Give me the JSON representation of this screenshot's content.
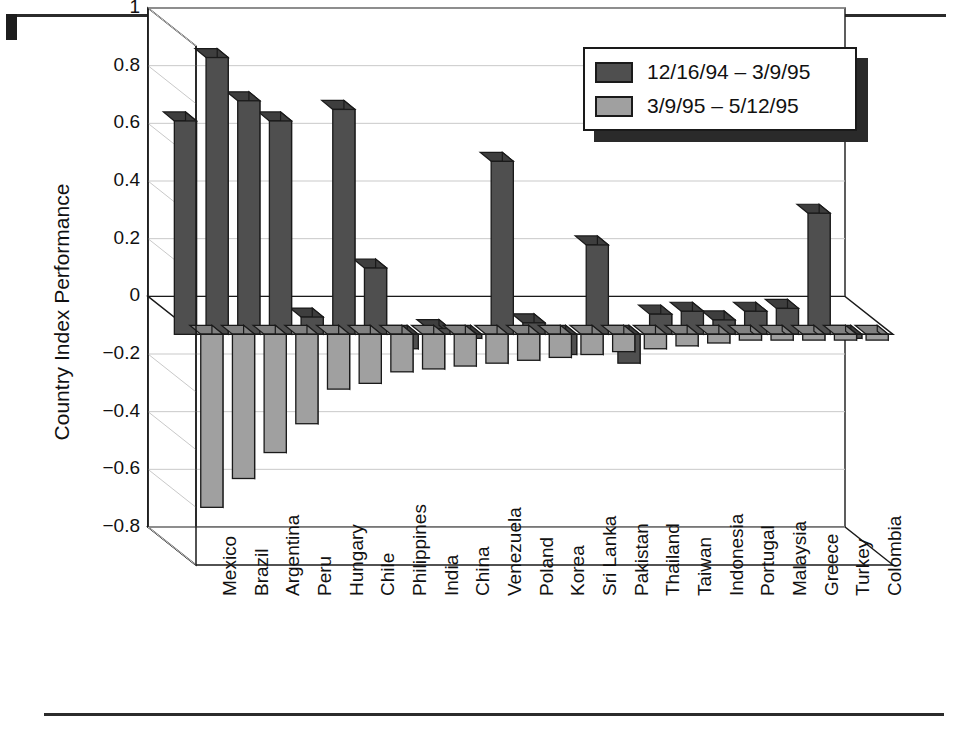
{
  "figure": {
    "has_top_rule": true,
    "has_bottom_rule": true
  },
  "legend": {
    "position": "top-right",
    "entries": [
      {
        "label": "12/16/94 – 3/9/95",
        "color": "#4f4f4f"
      },
      {
        "label": "3/9/95 – 5/12/95",
        "color": "#a0a0a0"
      }
    ]
  },
  "axis": {
    "ylabel": "Country Index Performance",
    "yticks": [
      "1",
      "0.8",
      "0.6",
      "0.4",
      "0.2",
      "0",
      "−0.2",
      "−0.4",
      "−0.6",
      "−0.8"
    ]
  },
  "chart_data": {
    "type": "bar",
    "title": "",
    "xlabel": "",
    "ylabel": "Country Index Performance",
    "ylim": [
      -0.8,
      1.0
    ],
    "ytick_values": [
      1,
      0.8,
      0.6,
      0.4,
      0.2,
      0,
      -0.2,
      -0.4,
      -0.6,
      -0.8
    ],
    "grid": true,
    "legend_position": "top-right",
    "style": "3d-grouped-bar",
    "categories": [
      "Mexico",
      "Brazil",
      "Argentina",
      "Peru",
      "Hungary",
      "Chile",
      "Philippines",
      "India",
      "China",
      "Venezuela",
      "Poland",
      "Korea",
      "Sri Lanka",
      "Pakistan",
      "Thailand",
      "Taiwan",
      "Indonesia",
      "Portugal",
      "Malaysia",
      "Greece",
      "Turkey",
      "Colombia"
    ],
    "series": [
      {
        "name": "12/16/94 – 3/9/95",
        "color": "#4f4f4f",
        "values": [
          0.74,
          0.96,
          0.81,
          0.74,
          0.06,
          0.78,
          0.23,
          -0.05,
          0.02,
          -0.01,
          0.6,
          0.04,
          -0.07,
          0.31,
          -0.1,
          0.07,
          0.08,
          0.05,
          0.08,
          0.09,
          0.42,
          0.0
        ]
      },
      {
        "name": "3/9/95 – 5/12/95",
        "color": "#a0a0a0",
        "values": [
          -0.6,
          -0.5,
          -0.41,
          -0.31,
          -0.19,
          -0.17,
          -0.13,
          -0.12,
          -0.11,
          -0.1,
          -0.09,
          -0.08,
          -0.07,
          -0.06,
          -0.05,
          -0.04,
          -0.03,
          -0.02,
          -0.02,
          -0.02,
          -0.02,
          -0.02
        ]
      }
    ]
  }
}
